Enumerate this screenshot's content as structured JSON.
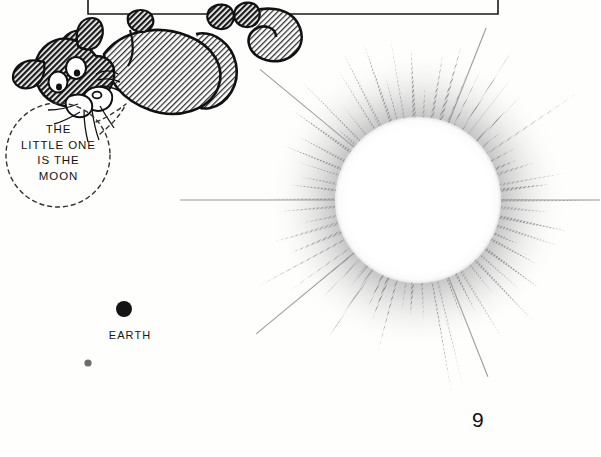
{
  "page": {
    "background_color": "#fefefd",
    "ink_color": "#1a1a1a",
    "page_number": "9"
  },
  "panel_frame": {
    "name": "caption-box-frame",
    "left": 88,
    "right": 498,
    "bottom": 14,
    "stroke": "#1a1a1a"
  },
  "speech_bubble": {
    "style": "dashed-circle",
    "center_x": 58,
    "center_y": 155,
    "radius": 52,
    "lines": [
      "THE",
      "LITTLE ONE",
      "IS THE",
      "MOON"
    ],
    "full_text": "THE LITTLE ONE IS THE MOON"
  },
  "character": {
    "name": "cat-hanging-upside-down",
    "description": "cartoon cat gripping the panel line with its paws, hanging upside down",
    "fur_color": "#555555",
    "outline_color": "#111111"
  },
  "sun": {
    "name": "sun",
    "center_x": 418,
    "center_y": 200,
    "disc_radius": 82,
    "ray_outer_radius": 168,
    "ray_count": 62,
    "disc_color": "#ffffff",
    "ray_color": "#8b8b8b"
  },
  "earth": {
    "name": "earth",
    "label": "EARTH",
    "dot_x": 124,
    "dot_y": 309,
    "dot_radius": 8,
    "dot_color": "#141414"
  },
  "moon": {
    "name": "moon",
    "label": "",
    "dot_x": 88,
    "dot_y": 363,
    "dot_radius": 3.6,
    "dot_color": "#6b6b6b"
  },
  "chart_data": {
    "type": "scatter",
    "xlabel": "",
    "ylabel": "",
    "categories": [
      "Sun",
      "Earth",
      "Moon"
    ],
    "values": [
      82,
      8,
      3.6
    ],
    "annotations": [
      "THE LITTLE ONE IS THE MOON",
      "EARTH"
    ],
    "grid": false,
    "legend": "none"
  }
}
